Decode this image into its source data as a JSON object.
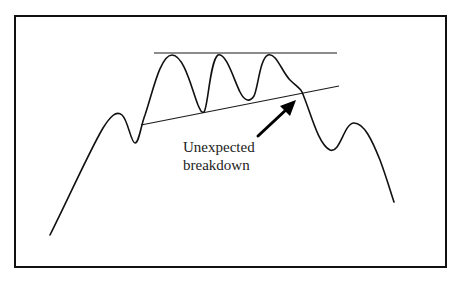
{
  "diagram": {
    "type": "chart-pattern",
    "annotation": {
      "line1": "Unexpected",
      "line2": "breakdown"
    },
    "colors": {
      "background": "#ffffff",
      "stroke": "#111111",
      "text": "#222222"
    },
    "elements": {
      "resistance_line": {
        "x1": 154,
        "y1": 53,
        "x2": 337,
        "y2": 53
      },
      "support_trendline": {
        "x1": 141,
        "y1": 125,
        "x2": 339,
        "y2": 86
      },
      "arrow": {
        "x1": 258,
        "y1": 136,
        "x2": 296,
        "y2": 100
      }
    }
  }
}
